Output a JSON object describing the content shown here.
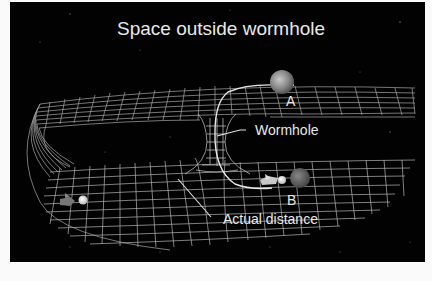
{
  "diagram": {
    "title": "Space outside wormhole",
    "labels": {
      "point_a": "A",
      "point_b": "B",
      "wormhole": "Wormhole",
      "actual_distance": "Actual distance"
    },
    "elements": [
      {
        "name": "folded-space-grid",
        "kind": "grid-surface",
        "description": "Space folded into a U-shape: upper sheet and lower sheet connected by curved left edge"
      },
      {
        "name": "wormhole-tube",
        "kind": "grid-tube",
        "description": "Narrow throat connecting upper sheet to lower sheet"
      },
      {
        "name": "planet-a",
        "kind": "planet",
        "on": "upper sheet"
      },
      {
        "name": "planet-b",
        "kind": "planet",
        "on": "lower sheet"
      },
      {
        "name": "spaceship-wormhole-path",
        "kind": "spaceship",
        "near": "B"
      },
      {
        "name": "spaceship-long-path",
        "kind": "spaceship",
        "near": "left of lower sheet"
      },
      {
        "name": "wormhole-path-line",
        "kind": "curve",
        "from": "A",
        "to": "B",
        "via": "wormhole"
      }
    ],
    "colors": {
      "background": "#020202",
      "grid": "#bdbdbd",
      "text": "#e8e8e8",
      "border": "#fafafa"
    }
  }
}
